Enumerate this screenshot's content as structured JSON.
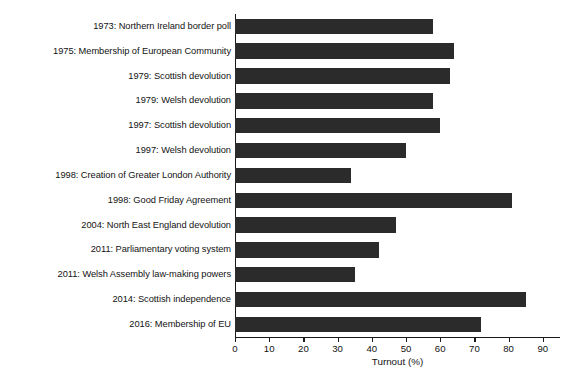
{
  "chart_data": {
    "type": "bar",
    "orientation": "horizontal",
    "title": "",
    "xlabel": "Turnout (%)",
    "ylabel": "",
    "xlim": [
      0,
      95
    ],
    "ylim": null,
    "grid": false,
    "legend": null,
    "bar_color": "#2b2b2b",
    "axis_color": "#1a1a1a",
    "xticks": [
      0,
      10,
      20,
      30,
      40,
      50,
      60,
      70,
      80,
      90
    ],
    "xtick_labels": [
      "0",
      "10",
      "20",
      "30",
      "40",
      "50",
      "60",
      "70",
      "80",
      "90"
    ],
    "categories": [
      "1973: Northern Ireland border poll",
      "1975: Membership of European Community",
      "1979: Scottish devolution",
      "1979: Welsh devolution",
      "1997: Scottish devolution",
      "1997: Welsh devolution",
      "1998: Creation of Greater London Authority",
      "1998: Good Friday Agreement",
      "2004: North East England devolution",
      "2011: Parliamentary voting system",
      "2011: Welsh Assembly law-making powers",
      "2014: Scottish independence",
      "2016: Membership of EU"
    ],
    "values": [
      58,
      64,
      63,
      58,
      60,
      50,
      34,
      81,
      47,
      42,
      35,
      85,
      72
    ]
  }
}
